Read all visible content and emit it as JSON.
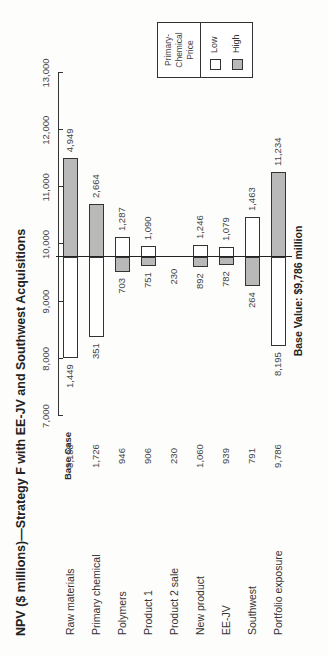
{
  "chart_data": {
    "type": "bar",
    "subtype": "tornado",
    "orientation_in_image": "rotated 90 degrees counter-clockwise",
    "title": "NPV ($ millions)—Strategy F with EE-JV and Southwest Acquisitions",
    "xlabel": "",
    "ylabel": "",
    "axis_range": [
      7000,
      13000
    ],
    "axis_ticks": [
      7000,
      8000,
      9000,
      10000,
      11000,
      12000,
      13000
    ],
    "axis_tick_labels": [
      "7,000",
      "8,000",
      "9,000",
      "10,000",
      "11,000",
      "12,000",
      "13,000"
    ],
    "base_value": 9786,
    "base_value_label": "Base Value: $9,786 million",
    "base_case_header": "Base Case",
    "legend": {
      "title": [
        "Primary-",
        "Chemical",
        "Price"
      ],
      "entries": [
        {
          "name": "Low",
          "color": "#ffffff"
        },
        {
          "name": "High",
          "color": "#b9b9b9"
        }
      ]
    },
    "categories": [
      "Raw materials",
      "Primary chemical",
      "Polymers",
      "Product 1",
      "Product 2 sale",
      "New product",
      "EE-JV",
      "Southwest",
      "Portfolio exposure"
    ],
    "base_case": [
      "3,188",
      "1,726",
      "946",
      "906",
      "230",
      "1,060",
      "939",
      "791",
      "9,786"
    ],
    "series": [
      {
        "name": "Low",
        "labels": [
          "1,449",
          "351",
          "1,287",
          "1,090",
          "230",
          "1,246",
          "1,079",
          "1,463",
          "8,195"
        ],
        "bar_end_npv": [
          8010,
          8380,
          10130,
          9970,
          null,
          9990,
          9955,
          10480,
          8220
        ]
      },
      {
        "name": "High",
        "labels": [
          "4,949",
          "2,664",
          "703",
          "751",
          "230",
          "892",
          "782",
          "264",
          "11,234"
        ],
        "bar_end_npv": [
          11510,
          10710,
          9520,
          9620,
          null,
          9605,
          9640,
          9270,
          11270
        ]
      }
    ],
    "grid": false,
    "legend_position": "top-right"
  }
}
